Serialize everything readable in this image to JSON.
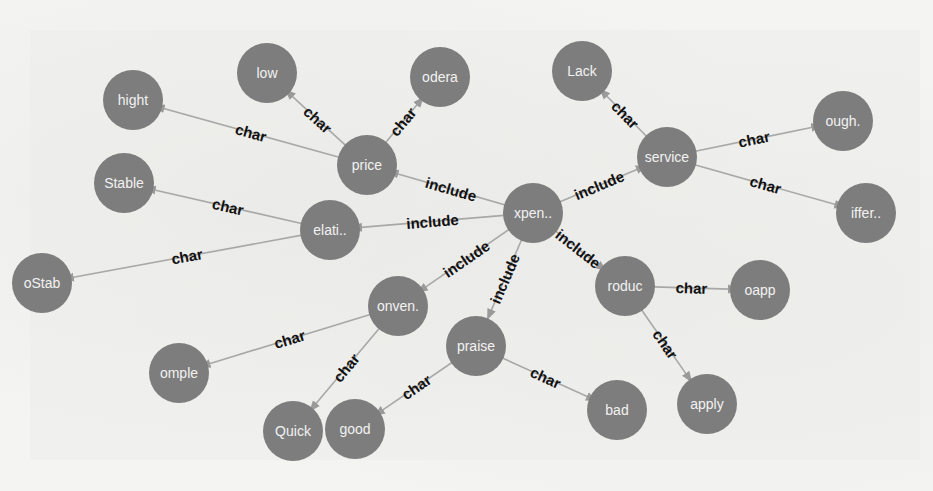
{
  "diagram": {
    "type": "knowledge-graph",
    "node_color": "#7d7d7d",
    "node_text_color": "#f2f2f2",
    "edge_color": "#a8a8a8",
    "edge_label_color": "#111111",
    "nodes": [
      {
        "id": "xpen",
        "label": "xpen..",
        "x": 533,
        "y": 213
      },
      {
        "id": "price",
        "label": "price",
        "x": 367,
        "y": 165
      },
      {
        "id": "elati",
        "label": "elati..",
        "x": 330,
        "y": 230
      },
      {
        "id": "service",
        "label": "service",
        "x": 667,
        "y": 157
      },
      {
        "id": "conven",
        "label": "onven.",
        "x": 398,
        "y": 306
      },
      {
        "id": "praise",
        "label": "praise",
        "x": 476,
        "y": 346
      },
      {
        "id": "produc",
        "label": "roduc",
        "x": 625,
        "y": 286
      },
      {
        "id": "hight",
        "label": "hight",
        "x": 133,
        "y": 100
      },
      {
        "id": "low",
        "label": "low",
        "x": 267,
        "y": 73
      },
      {
        "id": "odera",
        "label": "odera",
        "x": 440,
        "y": 77
      },
      {
        "id": "stable",
        "label": "Stable",
        "x": 124,
        "y": 183
      },
      {
        "id": "ostab",
        "label": "oStab",
        "x": 42,
        "y": 283
      },
      {
        "id": "lack",
        "label": "Lack",
        "x": 582,
        "y": 71
      },
      {
        "id": "ough",
        "label": "ough.",
        "x": 843,
        "y": 121
      },
      {
        "id": "differ",
        "label": "iffer..",
        "x": 866,
        "y": 213
      },
      {
        "id": "omple",
        "label": "omple",
        "x": 179,
        "y": 373
      },
      {
        "id": "quick",
        "label": "Quick",
        "x": 293,
        "y": 431
      },
      {
        "id": "good",
        "label": "good",
        "x": 355,
        "y": 429
      },
      {
        "id": "bad",
        "label": "bad",
        "x": 617,
        "y": 410
      },
      {
        "id": "oapp",
        "label": "oapp",
        "x": 760,
        "y": 290
      },
      {
        "id": "apply",
        "label": "apply",
        "x": 707,
        "y": 404
      }
    ],
    "edges": [
      {
        "from": "xpen",
        "to": "price",
        "label": "include"
      },
      {
        "from": "xpen",
        "to": "elati",
        "label": "include"
      },
      {
        "from": "xpen",
        "to": "service",
        "label": "include"
      },
      {
        "from": "xpen",
        "to": "conven",
        "label": "include"
      },
      {
        "from": "xpen",
        "to": "praise",
        "label": "include"
      },
      {
        "from": "xpen",
        "to": "produc",
        "label": "include"
      },
      {
        "from": "price",
        "to": "hight",
        "label": "char"
      },
      {
        "from": "price",
        "to": "low",
        "label": "char"
      },
      {
        "from": "price",
        "to": "odera",
        "label": "char"
      },
      {
        "from": "elati",
        "to": "stable",
        "label": "char"
      },
      {
        "from": "elati",
        "to": "ostab",
        "label": "char"
      },
      {
        "from": "service",
        "to": "lack",
        "label": "char"
      },
      {
        "from": "service",
        "to": "ough",
        "label": "char"
      },
      {
        "from": "service",
        "to": "differ",
        "label": "char"
      },
      {
        "from": "conven",
        "to": "omple",
        "label": "char"
      },
      {
        "from": "conven",
        "to": "quick",
        "label": "char"
      },
      {
        "from": "praise",
        "to": "good",
        "label": "char"
      },
      {
        "from": "praise",
        "to": "bad",
        "label": "char"
      },
      {
        "from": "produc",
        "to": "oapp",
        "label": "char"
      },
      {
        "from": "produc",
        "to": "apply",
        "label": "char"
      }
    ]
  }
}
